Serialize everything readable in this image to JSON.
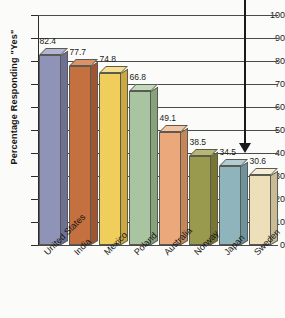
{
  "chart_data": {
    "type": "bar",
    "title": "",
    "xlabel": "",
    "ylabel": "Percentage Responding \"Yes\"",
    "ylim": [
      0,
      100
    ],
    "yticks": [
      "0",
      "10",
      "20",
      "30",
      "40",
      "50",
      "60",
      "70",
      "80",
      "90",
      "100"
    ],
    "grid": true,
    "legend": "none",
    "categories": [
      "United States",
      "India",
      "Mexico",
      "Poland",
      "Australia",
      "Norway",
      "Japan",
      "Sweden"
    ],
    "values": [
      82.4,
      77.7,
      74.8,
      66.8,
      49.1,
      38.5,
      34.5,
      30.6
    ],
    "value_labels": [
      "82.4",
      "77.7",
      "74.8",
      "66.8",
      "49.1",
      "38.5",
      "34.5",
      "30.6"
    ],
    "bar_colors": [
      "#9093b8",
      "#c4703f",
      "#f0ce5c",
      "#a9c4a0",
      "#eaa87b",
      "#9a9a4e",
      "#90b4bc",
      "#ecdfba"
    ],
    "bar_side_colors": [
      "#6d7095",
      "#9e5530",
      "#cba93f",
      "#86a37c",
      "#c78657",
      "#777732",
      "#6d939c",
      "#c9bb94"
    ],
    "bar_top_colors": [
      "#b3b5d2",
      "#d99367",
      "#f6e08d",
      "#c3d9bb",
      "#f3c5a2",
      "#b7b773",
      "#b1ccd3",
      "#f5ecd5"
    ],
    "annotation": {
      "name": "downward-arrow",
      "points_to": "Sweden"
    }
  }
}
